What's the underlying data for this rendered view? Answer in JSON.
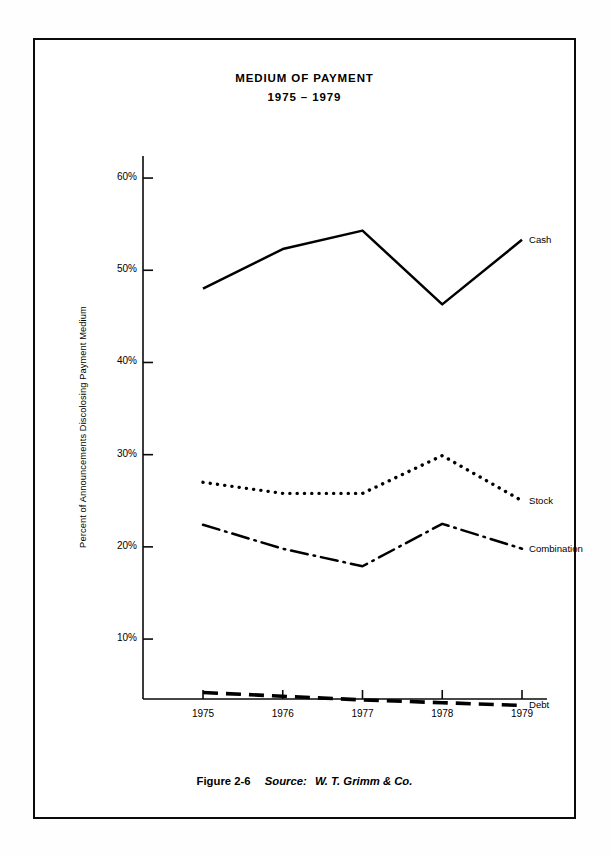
{
  "figure": {
    "title_line1": "MEDIUM OF PAYMENT",
    "title_line2": "1975 – 1979",
    "caption_figure_number": "Figure 2-6",
    "caption_source_label": "Source:",
    "caption_source_name": "W. T. Grimm & Co."
  },
  "chart_data": {
    "type": "line",
    "title": "MEDIUM OF PAYMENT 1975 – 1979",
    "subtitle": "1975 – 1979",
    "xlabel": "",
    "ylabel": "Percent of Announcements Discolosing Payment Medium",
    "x": [
      1975,
      1976,
      1977,
      1978,
      1979
    ],
    "categories": [
      "1975",
      "1976",
      "1977",
      "1978",
      "1979"
    ],
    "xtick_labels": [
      "1975",
      "1976",
      "1977",
      "1978",
      "1979"
    ],
    "ytick_labels": [
      "10%",
      "20%",
      "30%",
      "40%",
      "50%",
      "60%"
    ],
    "ytick_values": [
      10,
      20,
      30,
      40,
      50,
      60
    ],
    "ylim": [
      0,
      63
    ],
    "xlim": [
      1975,
      1979
    ],
    "grid": false,
    "legend_position": "right-of-line-ends",
    "series": [
      {
        "name": "Cash",
        "label": "Cash",
        "linestyle": "solid",
        "color": "#000000",
        "values": [
          48.0,
          52.3,
          54.3,
          46.3,
          53.3
        ]
      },
      {
        "name": "Stock",
        "label": "Stock",
        "linestyle": "dotted",
        "color": "#000000",
        "values": [
          27.0,
          25.8,
          25.8,
          29.9,
          25.0
        ]
      },
      {
        "name": "Combination",
        "label": "Combination",
        "linestyle": "dashdot",
        "color": "#000000",
        "values": [
          22.4,
          19.8,
          17.9,
          22.5,
          19.8
        ]
      },
      {
        "name": "Debt",
        "label": "Debt",
        "linestyle": "dashed",
        "color": "#000000",
        "values": [
          4.2,
          3.8,
          3.4,
          3.1,
          2.8
        ]
      }
    ]
  }
}
